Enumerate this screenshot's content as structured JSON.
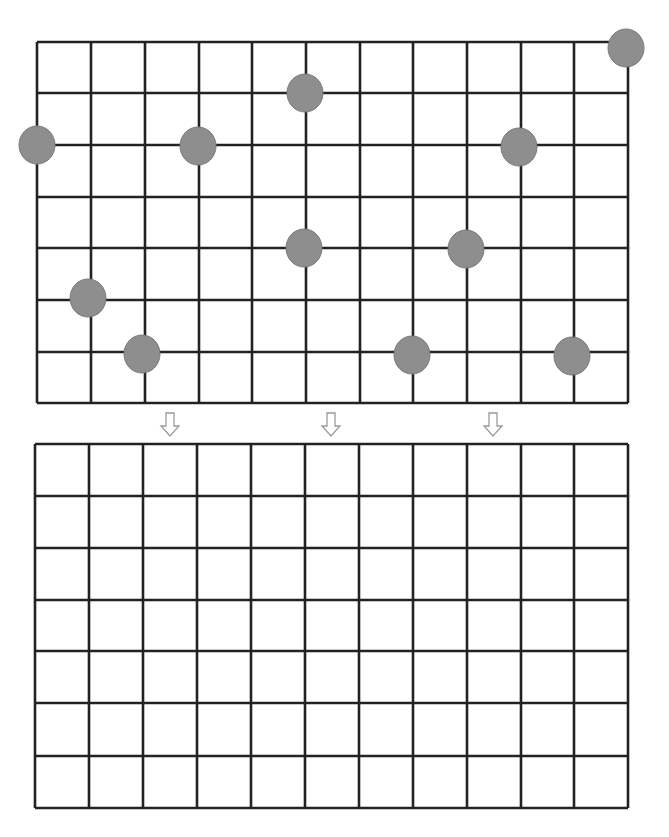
{
  "diagram": {
    "type": "grid-puzzle",
    "top_grid": {
      "cols": 11,
      "rows": 7,
      "x": [
        37,
        91,
        145,
        199,
        252,
        306,
        360,
        413,
        467,
        521,
        574,
        628
      ],
      "y": [
        42,
        93,
        145,
        197,
        248,
        300,
        352,
        403
      ],
      "dots": [
        {
          "col": 11,
          "row": 0,
          "cx": 626,
          "cy": 48
        },
        {
          "col": 5,
          "row": 1,
          "cx": 305,
          "cy": 93
        },
        {
          "col": 0,
          "row": 2,
          "cx": 37,
          "cy": 145
        },
        {
          "col": 3,
          "row": 2,
          "cx": 198,
          "cy": 146
        },
        {
          "col": 9,
          "row": 2,
          "cx": 519,
          "cy": 147
        },
        {
          "col": 5,
          "row": 4,
          "cx": 304,
          "cy": 248
        },
        {
          "col": 8,
          "row": 4,
          "cx": 466,
          "cy": 249
        },
        {
          "col": 1,
          "row": 5,
          "cx": 88,
          "cy": 298
        },
        {
          "col": 2,
          "row": 6,
          "cx": 142,
          "cy": 354
        },
        {
          "col": 7,
          "row": 6,
          "cx": 412,
          "cy": 355
        },
        {
          "col": 10,
          "row": 6,
          "cx": 572,
          "cy": 356
        }
      ]
    },
    "arrows": [
      {
        "cx": 170,
        "top": 413,
        "direction": "down"
      },
      {
        "cx": 331,
        "top": 413,
        "direction": "down"
      },
      {
        "cx": 493,
        "top": 413,
        "direction": "down"
      }
    ],
    "bottom_grid": {
      "cols": 11,
      "rows": 7,
      "x": [
        35,
        89,
        143,
        197,
        251,
        305,
        359,
        413,
        467,
        521,
        574,
        628
      ],
      "y": [
        444,
        496,
        548,
        600,
        651,
        703,
        756,
        808
      ],
      "dots": []
    },
    "colors": {
      "line": "#222222",
      "dot": "#8e8e8e",
      "arrow_outline": "#9a9a9a",
      "background": "#ffffff"
    }
  }
}
